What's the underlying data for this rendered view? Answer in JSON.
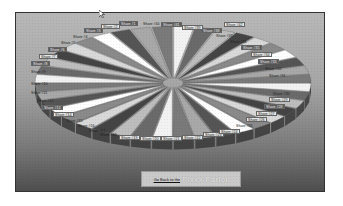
{
  "chart_data": {
    "type": "pie",
    "style": "3d-exploded",
    "title": "",
    "center": [
      157,
      70
    ],
    "slice_count": 40,
    "labels": [
      "Share #1",
      "Share #2",
      "Share #3",
      "Share #4",
      "Share #5",
      "Share #6",
      "Share #7",
      "Share #8",
      "Share #9",
      "Share #10",
      "Share #11",
      "Share #12",
      "Share #13",
      "Share #14",
      "Share #15",
      "Share #16",
      "Share #17",
      "Share #18",
      "Share #19",
      "Share #20",
      "Share #21",
      "Share #22",
      "Share #23",
      "Share #24",
      "Share #25",
      "Share #26",
      "Share #27",
      "Share #28",
      "Share #29",
      "Share #30",
      "Share #31",
      "Share #32",
      "Share #33",
      "Share #34",
      "Share #35",
      "Share #36",
      "Share #37",
      "Share #38",
      "Share #39",
      "Share #40"
    ],
    "values": [
      1,
      1,
      1,
      1,
      1,
      1,
      1,
      1,
      1,
      1,
      1,
      1,
      1,
      1,
      1,
      1,
      1,
      1,
      1,
      1,
      1,
      1,
      1,
      1,
      1,
      1,
      1,
      1,
      1,
      1,
      1,
      1,
      1,
      1,
      1,
      1,
      1,
      1,
      1,
      1
    ],
    "legend": "none",
    "grid": false
  },
  "labels": [
    {
      "text": "Share #1",
      "x": 118,
      "y": 20,
      "s": "dark"
    },
    {
      "text": "Share #2",
      "x": 100,
      "y": 23,
      "s": "light"
    },
    {
      "text": "Share #3",
      "x": 83,
      "y": 27,
      "s": "dark"
    },
    {
      "text": "Share #4",
      "x": 70,
      "y": 33,
      "s": "plain"
    },
    {
      "text": "Share #5",
      "x": 58,
      "y": 39,
      "s": "plain"
    },
    {
      "text": "Share #6",
      "x": 47,
      "y": 46,
      "s": "dark"
    },
    {
      "text": "Share #7",
      "x": 38,
      "y": 53,
      "s": "light"
    },
    {
      "text": "Share #8",
      "x": 30,
      "y": 60,
      "s": "dark"
    },
    {
      "text": "Share #9",
      "x": 28,
      "y": 68,
      "s": "plain"
    },
    {
      "text": "Share #10",
      "x": 28,
      "y": 80,
      "s": "plain"
    },
    {
      "text": "Share #11",
      "x": 28,
      "y": 89,
      "s": "plain"
    },
    {
      "text": "Share #12",
      "x": 34,
      "y": 97,
      "s": "plain"
    },
    {
      "text": "Share #13",
      "x": 41,
      "y": 104,
      "s": "dark"
    },
    {
      "text": "Share #14",
      "x": 52,
      "y": 111,
      "s": "light"
    },
    {
      "text": "Share #15",
      "x": 63,
      "y": 117,
      "s": "plain"
    },
    {
      "text": "Share #16",
      "x": 75,
      "y": 122,
      "s": "plain"
    },
    {
      "text": "Share #17",
      "x": 86,
      "y": 127,
      "s": "plain"
    },
    {
      "text": "Share #18",
      "x": 97,
      "y": 131,
      "s": "plain"
    },
    {
      "text": "Share #19",
      "x": 118,
      "y": 134,
      "s": "light"
    },
    {
      "text": "Share #20",
      "x": 139,
      "y": 135,
      "s": "light"
    },
    {
      "text": "Share #21",
      "x": 160,
      "y": 135,
      "s": "light"
    },
    {
      "text": "Share #22",
      "x": 181,
      "y": 134,
      "s": "light"
    },
    {
      "text": "Share #23",
      "x": 202,
      "y": 131,
      "s": "light"
    },
    {
      "text": "Share #24",
      "x": 218,
      "y": 128,
      "s": "light"
    },
    {
      "text": "Share #25",
      "x": 233,
      "y": 122,
      "s": "plain"
    },
    {
      "text": "Share #26",
      "x": 245,
      "y": 116,
      "s": "light"
    },
    {
      "text": "Share #27",
      "x": 255,
      "y": 110,
      "s": "light"
    },
    {
      "text": "Share #28",
      "x": 263,
      "y": 103,
      "s": "dark"
    },
    {
      "text": "Share #29",
      "x": 268,
      "y": 96,
      "s": "light"
    },
    {
      "text": "Share #30",
      "x": 270,
      "y": 90,
      "s": "plain"
    },
    {
      "text": "Share #31",
      "x": 266,
      "y": 72,
      "s": "plain"
    },
    {
      "text": "Share #32",
      "x": 262,
      "y": 65,
      "s": "plain"
    },
    {
      "text": "Share #33",
      "x": 257,
      "y": 58,
      "s": "dark"
    },
    {
      "text": "Share #34",
      "x": 250,
      "y": 51,
      "s": "light"
    },
    {
      "text": "Share #35",
      "x": 240,
      "y": 44,
      "s": "dark"
    },
    {
      "text": "Share #36",
      "x": 227,
      "y": 38,
      "s": "plain"
    },
    {
      "text": "Share #37",
      "x": 213,
      "y": 32,
      "s": "plain"
    },
    {
      "text": "Share #38",
      "x": 200,
      "y": 27,
      "s": "dark"
    },
    {
      "text": "Share #39",
      "x": 181,
      "y": 24,
      "s": "light"
    },
    {
      "text": "Share #40",
      "x": 140,
      "y": 20,
      "s": "plain"
    },
    {
      "text": "Share #41",
      "x": 160,
      "y": 21,
      "s": "dark"
    },
    {
      "text": "Share #42",
      "x": 223,
      "y": 21,
      "s": "light"
    }
  ],
  "back_button": {
    "link_text": "Go Back to the",
    "logo_text": "Pixxx Parlor"
  }
}
